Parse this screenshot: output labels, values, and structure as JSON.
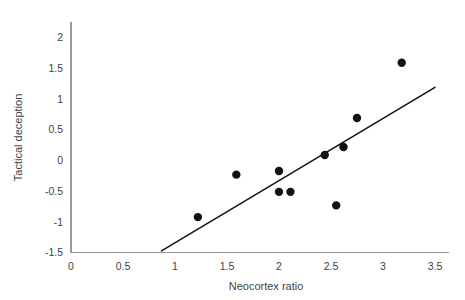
{
  "chart_data": {
    "type": "scatter",
    "title": "",
    "xlabel": "Neocortex ratio",
    "ylabel": "Tactical deception",
    "xlim": [
      0,
      3.5
    ],
    "ylim": [
      -1.5,
      2.25
    ],
    "grid": false,
    "legend": null,
    "x_ticks": [
      "0",
      "0.5",
      "1",
      "1.5",
      "2",
      "2.5",
      "3",
      "3.5"
    ],
    "x_tick_values": [
      0,
      0.5,
      1,
      1.5,
      2,
      2.5,
      3,
      3.5
    ],
    "y_ticks": [
      "2",
      "1.5",
      "1",
      "0.5",
      "0",
      "-0.5",
      "-1",
      "-1.5"
    ],
    "y_tick_values": [
      2,
      1.5,
      1,
      0.5,
      0,
      -0.5,
      -1,
      -1.5
    ],
    "points": [
      {
        "x": 1.22,
        "y": -0.92
      },
      {
        "x": 1.59,
        "y": -0.23
      },
      {
        "x": 2.0,
        "y": -0.17
      },
      {
        "x": 2.0,
        "y": -0.51
      },
      {
        "x": 2.11,
        "y": -0.51
      },
      {
        "x": 2.44,
        "y": 0.09
      },
      {
        "x": 2.55,
        "y": -0.73
      },
      {
        "x": 2.62,
        "y": 0.22
      },
      {
        "x": 2.75,
        "y": 0.69
      },
      {
        "x": 3.18,
        "y": 1.59
      }
    ],
    "point_marker": "filled-circle",
    "point_color": "#121212",
    "point_radius": 4.2,
    "trend_line": {
      "x_start": 0.87,
      "y_start": -1.47,
      "x_end": 3.5,
      "y_end": 1.19,
      "color": "#111111"
    },
    "axis_color": "#9a9a9a",
    "background_color": "#ffffff"
  }
}
